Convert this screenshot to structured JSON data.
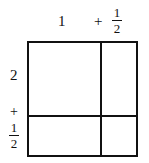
{
  "diagram": {
    "top_labels": {
      "whole": "1",
      "plus": "+",
      "fraction": {
        "numerator": "1",
        "denominator": "2"
      }
    },
    "left_labels": {
      "whole": "2",
      "plus": "+",
      "fraction": {
        "numerator": "1",
        "denominator": "2"
      }
    },
    "colors": {
      "line": "#111111",
      "background": "#ffffff"
    }
  }
}
